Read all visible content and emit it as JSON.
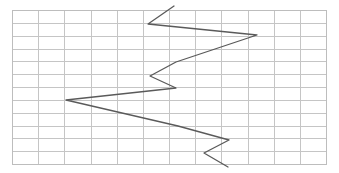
{
  "figure": {
    "title": "",
    "background_color": "#ffffff",
    "width": 339,
    "height": 173
  },
  "grid": {
    "x_start": 12,
    "y_start": 10,
    "x_end": 326,
    "y_end": 164,
    "columns": 12,
    "rows": 12,
    "cell_width": 26.17,
    "cell_height": 12.83,
    "line_color": "#c5c5c5",
    "border_color": "#bdbdbd",
    "visible": true
  },
  "chart_data": {
    "type": "line",
    "title": "",
    "xlabel": "",
    "ylabel": "",
    "grid": true,
    "legend": "none",
    "orientation": "vertical-progression",
    "xlim": [
      0,
      12
    ],
    "ylim": [
      0,
      12
    ],
    "series": [
      {
        "name": "zigzag-trace",
        "color": "#5a5a5a",
        "line_width": 1.3,
        "marker": "none",
        "points_px": [
          [
            174,
            6
          ],
          [
            148,
            24
          ],
          [
            257,
            35
          ],
          [
            176,
            62
          ],
          [
            150,
            76
          ],
          [
            176,
            88
          ],
          [
            66,
            100
          ],
          [
            178,
            126
          ],
          [
            229,
            140
          ],
          [
            204,
            153
          ],
          [
            228,
            167
          ]
        ],
        "x": [
          6.19,
          5.2,
          9.36,
          6.27,
          5.27,
          6.27,
          2.06,
          6.34,
          8.29,
          7.34,
          8.25
        ],
        "y": [
          11.69,
          10.29,
          9.43,
          7.32,
          6.23,
          5.3,
          4.37,
          2.34,
          1.25,
          0.23,
          -0.86
        ]
      }
    ]
  }
}
